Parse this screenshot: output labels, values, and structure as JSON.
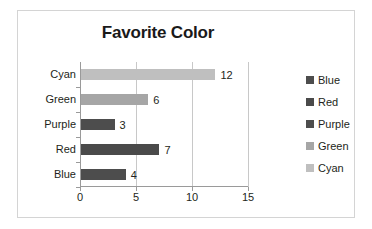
{
  "chart_data": {
    "type": "bar",
    "orientation": "horizontal",
    "title": "Favorite Color",
    "xlabel": "",
    "ylabel": "",
    "categories": [
      "Cyan",
      "Green",
      "Purple",
      "Red",
      "Blue"
    ],
    "values": [
      12,
      6,
      3,
      7,
      4
    ],
    "data_labels": [
      "12",
      "6",
      "3",
      "7",
      "4"
    ],
    "xlim": [
      0,
      15
    ],
    "xticks": [
      0,
      5,
      10,
      15
    ],
    "xtick_labels": [
      "0",
      "5",
      "10",
      "15"
    ],
    "grid": "vertical",
    "legend_position": "right",
    "legend": [
      {
        "label": "Blue",
        "color": "#4d4d4d"
      },
      {
        "label": "Red",
        "color": "#4a4a4a"
      },
      {
        "label": "Purple",
        "color": "#4d4d4d"
      },
      {
        "label": "Green",
        "color": "#a6a6a6"
      },
      {
        "label": "Cyan",
        "color": "#bfbfbf"
      }
    ],
    "bars": [
      {
        "category": "Cyan",
        "value": 12,
        "label": "12",
        "color": "#bfbfbf"
      },
      {
        "category": "Green",
        "value": 6,
        "label": "6",
        "color": "#a6a6a6"
      },
      {
        "category": "Purple",
        "value": 3,
        "label": "3",
        "color": "#4d4d4d"
      },
      {
        "category": "Red",
        "value": 7,
        "label": "7",
        "color": "#4a4a4a"
      },
      {
        "category": "Blue",
        "value": 4,
        "label": "4",
        "color": "#4d4d4d"
      }
    ]
  },
  "colors": {
    "frame_border": "#d4d4d4",
    "axis": "#9a9a9a",
    "gridline": "#c8c8c8",
    "text": "#231f20",
    "background": "#ffffff"
  }
}
